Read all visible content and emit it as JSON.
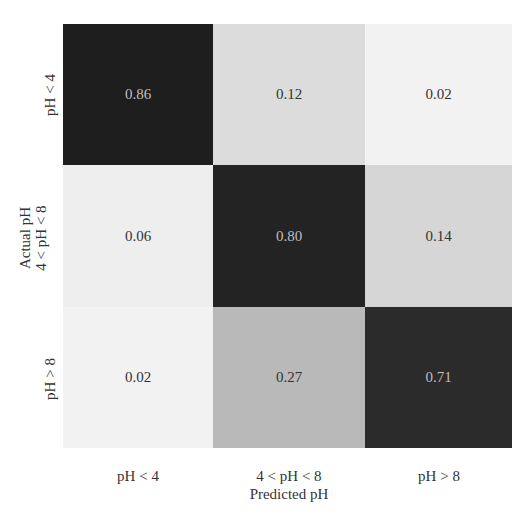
{
  "chart_data": {
    "type": "heatmap",
    "title": "",
    "xlabel": "Predicted pH",
    "ylabel": "Actual pH",
    "x_categories": [
      "pH < 4",
      "4 < pH < 8",
      "pH > 8"
    ],
    "y_categories": [
      "pH < 4",
      "4 < pH < 8",
      "pH > 8"
    ],
    "values": [
      [
        0.86,
        0.12,
        0.02
      ],
      [
        0.06,
        0.8,
        0.14
      ],
      [
        0.02,
        0.27,
        0.71
      ]
    ],
    "display_values": [
      [
        "0.86",
        "0.12",
        "0.02"
      ],
      [
        "0.06",
        "0.80",
        "0.14"
      ],
      [
        "0.02",
        "0.27",
        "0.71"
      ]
    ],
    "colorscale": "greys",
    "colorbar": false
  },
  "cell_colors": [
    [
      "#1e1e1e",
      "#dcdcdc",
      "#f2f2f2"
    ],
    [
      "#eeeeee",
      "#232323",
      "#d6d6d6"
    ],
    [
      "#f2f2f2",
      "#b9b9b9",
      "#2b2b2b"
    ]
  ],
  "cell_text_colors": [
    [
      "#bfbfbf",
      "#333333",
      "#333333"
    ],
    [
      "#333333",
      "#bfbfbf",
      "#333333"
    ],
    [
      "#333333",
      "#333333",
      "#bfbfbf"
    ]
  ]
}
